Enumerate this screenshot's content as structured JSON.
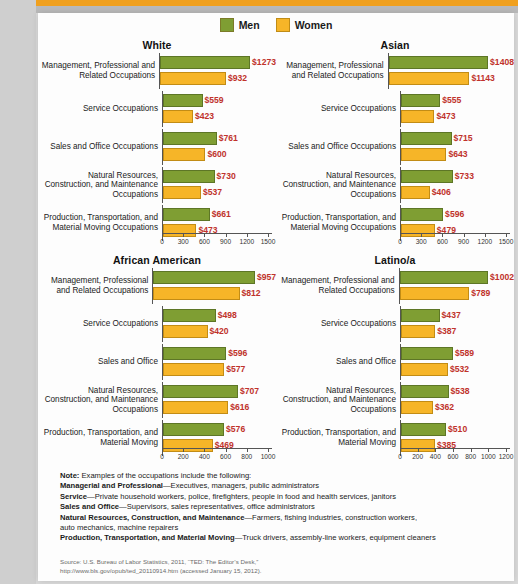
{
  "legend": {
    "items": [
      {
        "label": "Men",
        "color": "#7f9e33",
        "key": "men"
      },
      {
        "label": "Women",
        "color": "#f6b528",
        "key": "women"
      }
    ]
  },
  "chart_data": [
    {
      "type": "bar",
      "title": "White",
      "orientation": "horizontal",
      "xlabel": "",
      "ylabel": "",
      "xlim": [
        0,
        1500
      ],
      "ticks": [
        0,
        300,
        600,
        900,
        1200,
        1500
      ],
      "grid": false,
      "legend_position": "top-center",
      "categories": [
        "Management, Professional and Related Occupations",
        "Service Occupations",
        "Sales and Office Occupations",
        "Natural Resources, Construction, and Maintenance Occupations",
        "Production, Transportation, and Material Moving Occupations"
      ],
      "series": [
        {
          "name": "Men",
          "values": [
            1273,
            559,
            761,
            730,
            661
          ],
          "labels": [
            "$1273",
            "$559",
            "$761",
            "$730",
            "$661"
          ]
        },
        {
          "name": "Women",
          "values": [
            932,
            423,
            600,
            537,
            473
          ],
          "labels": [
            "$932",
            "$423",
            "$600",
            "$537",
            "$473"
          ]
        }
      ]
    },
    {
      "type": "bar",
      "title": "Asian",
      "orientation": "horizontal",
      "xlabel": "",
      "ylabel": "",
      "xlim": [
        0,
        1500
      ],
      "ticks": [
        0,
        300,
        600,
        900,
        1200,
        1500
      ],
      "grid": false,
      "legend_position": "top-center",
      "categories": [
        "Management, Professional and Related Occupations",
        "Service Occupations",
        "Sales and Office Occupations",
        "Natural Resources, Construction, and Maintenance Occupations",
        "Production, Transportation, and Material Moving Occupations"
      ],
      "series": [
        {
          "name": "Men",
          "values": [
            1408,
            555,
            715,
            733,
            596
          ],
          "labels": [
            "$1408",
            "$555",
            "$715",
            "$733",
            "$596"
          ]
        },
        {
          "name": "Women",
          "values": [
            1143,
            473,
            643,
            406,
            479
          ],
          "labels": [
            "$1143",
            "$473",
            "$643",
            "$406",
            "$479"
          ]
        }
      ]
    },
    {
      "type": "bar",
      "title": "African American",
      "orientation": "horizontal",
      "xlabel": "",
      "ylabel": "",
      "xlim": [
        0,
        1000
      ],
      "ticks": [
        0,
        200,
        400,
        600,
        800,
        1000
      ],
      "grid": false,
      "legend_position": "top-center",
      "categories": [
        "Management, Professional and Related Occupations",
        "Service Occupations",
        "Sales and Office",
        "Natural Resources, Construction, and Maintenance Occupations",
        "Production, Transportation, and Material Moving"
      ],
      "series": [
        {
          "name": "Men",
          "values": [
            957,
            498,
            596,
            707,
            576
          ],
          "labels": [
            "$957",
            "$498",
            "$596",
            "$707",
            "$576"
          ]
        },
        {
          "name": "Women",
          "values": [
            812,
            420,
            577,
            616,
            469
          ],
          "labels": [
            "$812",
            "$420",
            "$577",
            "$616",
            "$469"
          ]
        }
      ]
    },
    {
      "type": "bar",
      "title": "Latino/a",
      "orientation": "horizontal",
      "xlabel": "",
      "ylabel": "",
      "xlim": [
        0,
        1200
      ],
      "ticks": [
        0,
        200,
        400,
        600,
        800,
        1000,
        1200
      ],
      "grid": false,
      "legend_position": "top-center",
      "categories": [
        "Management, Professional and Related Occupations",
        "Service Occupations",
        "Sales and Office",
        "Natural Resources, Construction, and Maintenance Occupations",
        "Production, Transportation, and Material Moving"
      ],
      "series": [
        {
          "name": "Men",
          "values": [
            1002,
            437,
            589,
            538,
            510
          ],
          "labels": [
            "$1002",
            "$437",
            "$589",
            "$538",
            "$510"
          ]
        },
        {
          "name": "Women",
          "values": [
            789,
            387,
            532,
            362,
            385
          ],
          "labels": [
            "$789",
            "$387",
            "$532",
            "$362",
            "$385"
          ]
        }
      ]
    }
  ],
  "notes": {
    "lines": [
      {
        "bold": "Note:",
        "rest": " Examples of the occupations include the following:"
      },
      {
        "bold": "Managerial and Professional",
        "rest": "—Executives, managers, public administrators"
      },
      {
        "bold": "Service",
        "rest": "—Private household workers, police, firefighters, people in food and health services, janitors"
      },
      {
        "bold": "Sales and Office",
        "rest": "—Supervisors, sales representatives, office administrators"
      },
      {
        "bold": "Natural Resources, Construction, and Maintenance",
        "rest": "—Farmers, fishing industries, construction workers,"
      },
      {
        "bold": "",
        "rest": "auto mechanics, machine repairers"
      },
      {
        "bold": "Production, Transportation, and Material Moving",
        "rest": "—Truck drivers, assembly-line workers, equipment cleaners"
      }
    ]
  },
  "source": {
    "line1": "Source: U.S. Bureau of Labor Statistics, 2011, “TED: The Editor’s Desk,”",
    "line2": "http://www.bls.gov/opub/ted_20110914.htm (accessed January 15, 2012)."
  },
  "colors": {
    "men": "#7f9e33",
    "women": "#f6b528",
    "value_label": "#c0322b",
    "top_bar": "#f0a01e"
  }
}
